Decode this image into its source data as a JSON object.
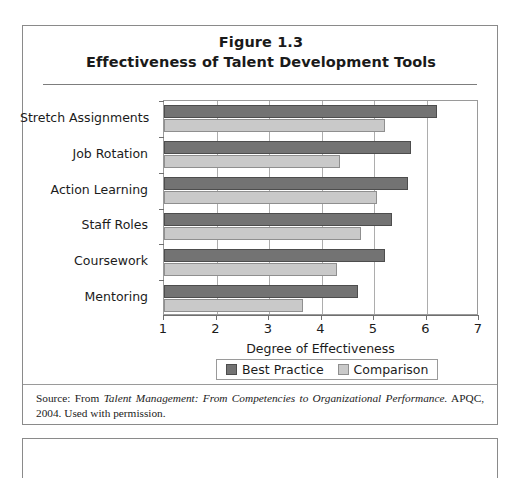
{
  "figure": {
    "title_line_1": "Figure 1.3",
    "title_line_2": "Effectiveness of Talent Development Tools",
    "source_prefix": "Source: From ",
    "source_italic": "Talent Management: From Competencies to Organizational Performance.",
    "source_suffix": " APQC, 2004. Used with permission."
  },
  "chart_data": {
    "type": "bar",
    "orientation": "horizontal",
    "title": "Effectiveness of Talent Development Tools",
    "subtitle": "Figure 1.3",
    "categories": [
      "Stretch Assignments",
      "Job Rotation",
      "Action Learning",
      "Staff Roles",
      "Coursework",
      "Mentoring"
    ],
    "series": [
      {
        "name": "Best Practice",
        "color": "#737373",
        "values": [
          6.2,
          5.7,
          5.65,
          5.35,
          5.2,
          4.7
        ]
      },
      {
        "name": "Comparison",
        "color": "#c9c9c9",
        "values": [
          5.2,
          4.35,
          5.05,
          4.75,
          4.3,
          3.65
        ]
      }
    ],
    "xlabel": "Degree of Effectiveness",
    "ylabel": "",
    "xlim": [
      1,
      7
    ],
    "xticks": [
      1,
      2,
      3,
      4,
      5,
      6,
      7
    ],
    "grid": true,
    "grid_axis": "x",
    "legend_position": "bottom"
  },
  "colors": {
    "best_practice": "#737373",
    "comparison": "#c9c9c9",
    "frame": "#8a8a8a",
    "gridline": "#adadad",
    "text": "#1b1b1b"
  }
}
